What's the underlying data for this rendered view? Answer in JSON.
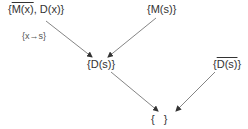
{
  "diagram": {
    "type": "directed-graph",
    "nodes": [
      {
        "id": "A",
        "open": "{",
        "parts": [
          {
            "text": "M(x)",
            "overline": true
          },
          {
            "text": ", ",
            "overline": false
          },
          {
            "text": "D(x)",
            "overline": false
          }
        ],
        "close": "}",
        "label": "{M̅(x), D(x)}"
      },
      {
        "id": "B",
        "open": "{",
        "parts": [
          {
            "text": "M(s)",
            "overline": false
          }
        ],
        "close": "}",
        "label": "{M(s)}"
      },
      {
        "id": "C",
        "open": "{",
        "parts": [
          {
            "text": "D(s)",
            "overline": false
          }
        ],
        "close": "}",
        "label": "{D(s)}"
      },
      {
        "id": "D",
        "open": "{",
        "parts": [
          {
            "text": "D(s)",
            "overline": true
          }
        ],
        "close": "}",
        "label": "{D̅(s)}"
      },
      {
        "id": "E",
        "open": "{",
        "parts": [
          {
            "text": "   ",
            "overline": false
          }
        ],
        "close": "}",
        "label": "{ }"
      }
    ],
    "edges": [
      {
        "from": "A",
        "to": "C",
        "label": "{x→s}"
      },
      {
        "from": "B",
        "to": "C",
        "label": ""
      },
      {
        "from": "C",
        "to": "E",
        "label": ""
      },
      {
        "from": "D",
        "to": "E",
        "label": ""
      }
    ],
    "colors": {
      "text": "#333333",
      "edge": "#555555",
      "background": "#ffffff"
    }
  }
}
